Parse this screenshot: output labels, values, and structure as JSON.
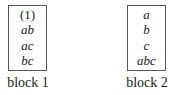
{
  "blocks": [
    {
      "label": "block 1",
      "items": [
        {
          "text": "(1)",
          "italic": false
        },
        {
          "text": "ab",
          "italic": true
        },
        {
          "text": "ac",
          "italic": true
        },
        {
          "text": "bc",
          "italic": true
        }
      ]
    },
    {
      "label": "block 2",
      "items": [
        {
          "text": "a",
          "italic": true
        },
        {
          "text": "b",
          "italic": true
        },
        {
          "text": "c",
          "italic": true
        },
        {
          "text": "abc",
          "italic": true
        }
      ]
    }
  ]
}
